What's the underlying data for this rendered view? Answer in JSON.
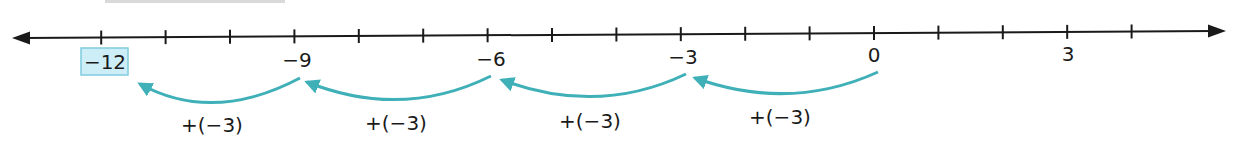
{
  "diagram": {
    "type": "number-line",
    "title_cutoff": "",
    "axis": {
      "min_visible": -13,
      "max_visible": 4,
      "tick_step": 1,
      "ticks": [
        -12,
        -11,
        -10,
        -9,
        -8,
        -7,
        -6,
        -5,
        -4,
        -3,
        -2,
        -1,
        0,
        1,
        2,
        3,
        4
      ],
      "labeled_ticks": [
        {
          "value": -12,
          "label": "−12",
          "highlighted": true
        },
        {
          "value": -9,
          "label": "−9",
          "highlighted": false
        },
        {
          "value": -6,
          "label": "−6",
          "highlighted": false
        },
        {
          "value": -3,
          "label": "−3",
          "highlighted": false
        },
        {
          "value": 0,
          "label": "0",
          "highlighted": false
        },
        {
          "value": 3,
          "label": "3",
          "highlighted": false
        }
      ],
      "arrows": [
        "left-arrow-icon",
        "right-arrow-icon"
      ]
    },
    "jumps": [
      {
        "from": 0,
        "to": -3,
        "label": "+(−3)"
      },
      {
        "from": -3,
        "to": -6,
        "label": "+(−3)"
      },
      {
        "from": -6,
        "to": -9,
        "label": "+(−3)"
      },
      {
        "from": -9,
        "to": -12,
        "label": "+(−3)"
      }
    ],
    "result": {
      "value": -12,
      "label": "−12"
    },
    "colors": {
      "axis": "#1a1a1a",
      "jump_arc": "#3fb0b8",
      "highlight_fill": "#cdeef6",
      "highlight_border": "#7fcbe0",
      "text": "#1a1a1a"
    }
  }
}
